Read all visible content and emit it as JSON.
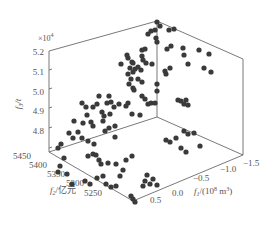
{
  "chart_data": {
    "type": "scatter3d",
    "title": "",
    "axes": {
      "x": {
        "label": "f1/(10^8 m^3)",
        "label_display": "f₁/(10⁸ m³)",
        "ticks": [
          0.5,
          0.0,
          -0.5,
          -1.0,
          -1.5
        ],
        "range": [
          0.5,
          -1.5
        ]
      },
      "y": {
        "label": "f2/亿元",
        "label_display": "f₂/亿元",
        "ticks": [
          5450,
          5400,
          5350,
          5300,
          5250
        ],
        "range": [
          5450,
          5250
        ]
      },
      "z": {
        "label": "f3/t",
        "label_display": "f₃/t",
        "ticks": [
          4.8,
          4.9,
          5.0,
          5.1,
          5.2
        ],
        "multiplier": "×10⁴",
        "range": [
          4.75,
          5.2
        ]
      }
    },
    "grid": false,
    "legend": null,
    "marker": {
      "shape": "circle",
      "color": "#3a3a3a"
    },
    "points_screen": [
      [
        157,
        22
      ],
      [
        160,
        26
      ],
      [
        151,
        31
      ],
      [
        148,
        34
      ],
      [
        155,
        30
      ],
      [
        169,
        30
      ],
      [
        174,
        29
      ],
      [
        156,
        38
      ],
      [
        157,
        42
      ],
      [
        142,
        50
      ],
      [
        145,
        49
      ],
      [
        142,
        56
      ],
      [
        143,
        60
      ],
      [
        146,
        63
      ],
      [
        167,
        49
      ],
      [
        171,
        46
      ],
      [
        183,
        48
      ],
      [
        184,
        55
      ],
      [
        188,
        64
      ],
      [
        199,
        50
      ],
      [
        209,
        54
      ],
      [
        138,
        67
      ],
      [
        141,
        70
      ],
      [
        152,
        64
      ],
      [
        133,
        72
      ],
      [
        165,
        71
      ],
      [
        166,
        74
      ],
      [
        170,
        68
      ],
      [
        204,
        68
      ],
      [
        211,
        72
      ],
      [
        128,
        74
      ],
      [
        131,
        79
      ],
      [
        129,
        84
      ],
      [
        134,
        90
      ],
      [
        157,
        84
      ],
      [
        157,
        91
      ],
      [
        145,
        99
      ],
      [
        148,
        104
      ],
      [
        151,
        103
      ],
      [
        155,
        103
      ],
      [
        178,
        100
      ],
      [
        181,
        101
      ],
      [
        184,
        104
      ],
      [
        186,
        100
      ],
      [
        188,
        105
      ],
      [
        127,
        55
      ],
      [
        128,
        58
      ],
      [
        133,
        63
      ],
      [
        130,
        68
      ],
      [
        138,
        79
      ],
      [
        142,
        82
      ],
      [
        133,
        88
      ],
      [
        142,
        96
      ],
      [
        121,
        64
      ],
      [
        132,
        62
      ],
      [
        135,
        69
      ],
      [
        128,
        103
      ],
      [
        126,
        106
      ],
      [
        132,
        114
      ],
      [
        140,
        115
      ],
      [
        119,
        104
      ],
      [
        111,
        102
      ],
      [
        99,
        96
      ],
      [
        109,
        96
      ],
      [
        107,
        103
      ],
      [
        114,
        107
      ],
      [
        110,
        114
      ],
      [
        102,
        112
      ],
      [
        104,
        116
      ],
      [
        97,
        104
      ],
      [
        93,
        107
      ],
      [
        91,
        122
      ],
      [
        93,
        126
      ],
      [
        103,
        121
      ],
      [
        105,
        131
      ],
      [
        109,
        128
      ],
      [
        115,
        126
      ],
      [
        115,
        137
      ],
      [
        82,
        103
      ],
      [
        86,
        107
      ],
      [
        87,
        115
      ],
      [
        83,
        123
      ],
      [
        74,
        121
      ],
      [
        78,
        132
      ],
      [
        82,
        138
      ],
      [
        88,
        141
      ],
      [
        94,
        144
      ],
      [
        88,
        156
      ],
      [
        93,
        154
      ],
      [
        96,
        155
      ],
      [
        99,
        160
      ],
      [
        101,
        164
      ],
      [
        97,
        178
      ],
      [
        103,
        176
      ],
      [
        108,
        163
      ],
      [
        116,
        164
      ],
      [
        69,
        133
      ],
      [
        73,
        138
      ],
      [
        61,
        144
      ],
      [
        58,
        148
      ],
      [
        64,
        158
      ],
      [
        60,
        166
      ],
      [
        58,
        172
      ],
      [
        67,
        174
      ],
      [
        72,
        184
      ],
      [
        85,
        181
      ],
      [
        90,
        184
      ],
      [
        106,
        184
      ],
      [
        111,
        187
      ],
      [
        116,
        186
      ],
      [
        120,
        176
      ],
      [
        123,
        170
      ],
      [
        126,
        160
      ],
      [
        132,
        156
      ],
      [
        131,
        196
      ],
      [
        133,
        199
      ],
      [
        135,
        202
      ],
      [
        147,
        175
      ],
      [
        145,
        181
      ],
      [
        143,
        186
      ],
      [
        150,
        184
      ],
      [
        153,
        179
      ],
      [
        157,
        185
      ],
      [
        166,
        140
      ],
      [
        170,
        142
      ],
      [
        176,
        138
      ],
      [
        181,
        148
      ],
      [
        186,
        152
      ],
      [
        184,
        131
      ],
      [
        188,
        134
      ],
      [
        194,
        133
      ],
      [
        200,
        146
      ]
    ]
  }
}
